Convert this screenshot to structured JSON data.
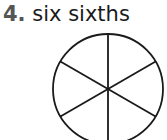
{
  "question": {
    "number": "4.",
    "label": "six sixths"
  },
  "figure": {
    "shape": "circle",
    "divisions": 6
  }
}
